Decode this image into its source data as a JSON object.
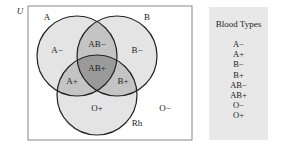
{
  "diagram": {
    "universe_label": "U",
    "set_labels": {
      "a": "A",
      "b": "B",
      "rh": "Rh"
    },
    "regions": {
      "a_only": "A−",
      "b_only": "B−",
      "ab": "AB−",
      "abrh": "AB+",
      "arh": "A+",
      "brh": "B+",
      "rh_only": "O+",
      "none": "O−"
    },
    "colors": {
      "single": "#e4e4e4",
      "double": "#c4c4c4",
      "triple": "#9a9a9a",
      "outline": "#222222"
    }
  },
  "legend": {
    "title": "Blood Types",
    "items": [
      "A−",
      "A+",
      "B−",
      "B+",
      "AB−",
      "AB+",
      "O−",
      "O+"
    ]
  }
}
